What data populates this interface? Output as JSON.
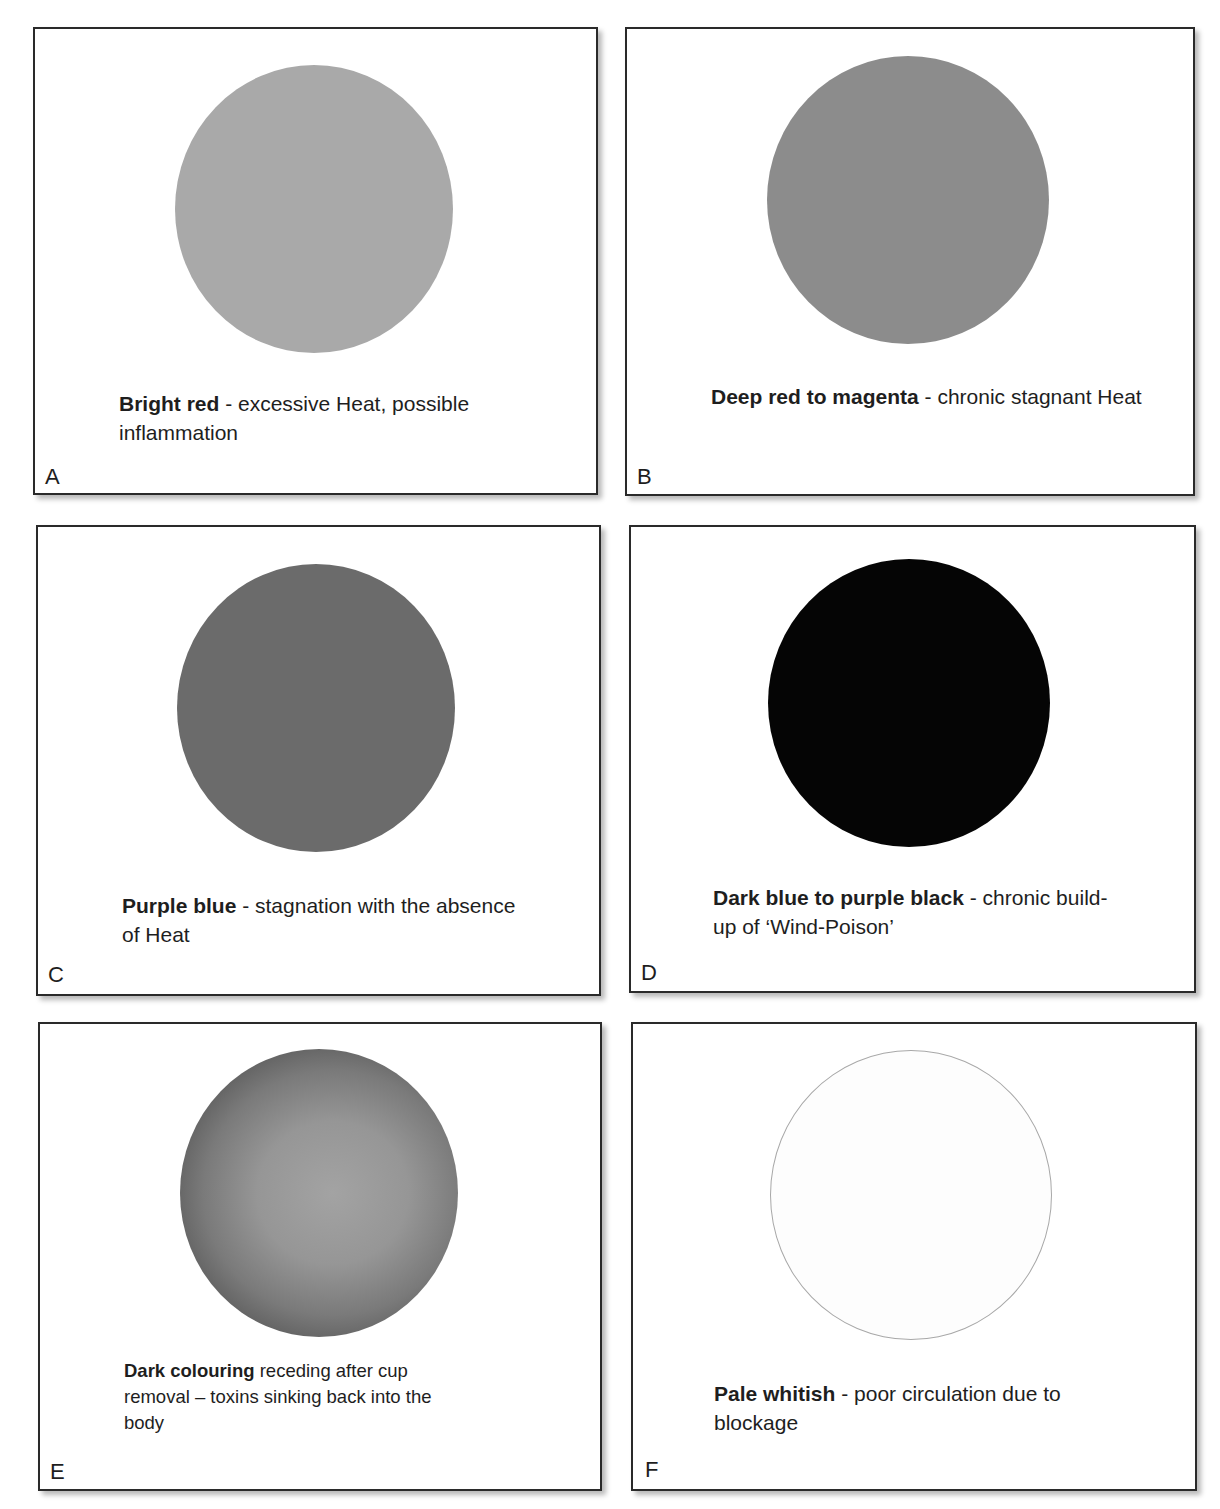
{
  "figure": {
    "type": "cupping-mark-colour-guide",
    "panels": [
      {
        "letter": "A",
        "title": "Bright red",
        "separator": " - ",
        "description": "excessive Heat, possible inflammation",
        "mark_color": "#a9a9a9",
        "mark_style": "solid"
      },
      {
        "letter": "B",
        "title": "Deep red to magenta",
        "separator": " - ",
        "description": "chronic stagnant Heat",
        "mark_color": "#8c8c8c",
        "mark_style": "solid"
      },
      {
        "letter": "C",
        "title": "Purple blue",
        "separator": " - ",
        "description": "stagnation with the absence of Heat",
        "mark_color": "#6b6b6b",
        "mark_style": "solid"
      },
      {
        "letter": "D",
        "title": "Dark blue to purple black",
        "separator": " - ",
        "description": "chronic build-up of ‘Wind-Poison’",
        "mark_color": "#050505",
        "mark_style": "solid"
      },
      {
        "letter": "E",
        "title": "Dark colouring",
        "separator": " ",
        "description": "receding after cup removal – toxins sinking back into the body",
        "mark_color_center": "#9d9d9d",
        "mark_color_edge": "#3a3a3a",
        "mark_style": "radial-gradient"
      },
      {
        "letter": "F",
        "title": "Pale whitish",
        "separator": " - ",
        "description": "poor circulation due to blockage",
        "mark_color": "#fdfdfd",
        "mark_outline": "#a8a8a8",
        "mark_style": "outline"
      }
    ]
  }
}
